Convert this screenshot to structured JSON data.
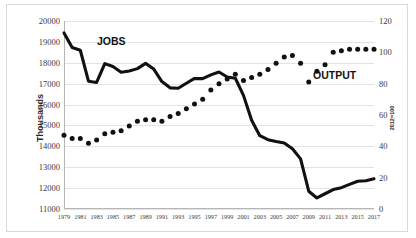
{
  "chart_data": {
    "type": "line",
    "title": "",
    "xlabel": "",
    "ylabel": "Thousands",
    "y2label": "2012=100",
    "grid": true,
    "legend_position": "inline-annotation",
    "x": [
      1979,
      1980,
      1981,
      1982,
      1983,
      1984,
      1985,
      1986,
      1987,
      1988,
      1989,
      1990,
      1991,
      1992,
      1993,
      1994,
      1995,
      1996,
      1997,
      1998,
      1999,
      2000,
      2001,
      2002,
      2003,
      2004,
      2005,
      2006,
      2007,
      2008,
      2009,
      2010,
      2011,
      2012,
      2013,
      2014,
      2015,
      2016,
      2017
    ],
    "xtick_labels": [
      "1979",
      "1981",
      "1983",
      "1985",
      "1987",
      "1989",
      "1991",
      "1993",
      "1995",
      "1997",
      "1999",
      "2001",
      "2003",
      "2005",
      "2007",
      "2009",
      "2011",
      "2013",
      "2015",
      "2017"
    ],
    "ylim": [
      11000,
      20000
    ],
    "ytick_labels": [
      "11000",
      "12000",
      "13000",
      "14000",
      "15000",
      "16000",
      "17000",
      "18000",
      "19000",
      "20000"
    ],
    "y2lim": [
      0,
      120
    ],
    "y2tick_labels": [
      "0",
      "20",
      "40",
      "60",
      "80",
      "100",
      "120"
    ],
    "series": [
      {
        "name": "JOBS",
        "axis": "left",
        "style": "solid-line",
        "unit": "thousands of jobs",
        "values": [
          19430,
          18730,
          18600,
          17120,
          17060,
          17960,
          17820,
          17550,
          17610,
          17720,
          17970,
          17700,
          17100,
          16800,
          16780,
          17020,
          17250,
          17240,
          17420,
          17560,
          17320,
          17260,
          16440,
          15250,
          14510,
          14320,
          14230,
          14160,
          13880,
          13400,
          11850,
          11530,
          11730,
          11930,
          12020,
          12180,
          12330,
          12350,
          12450
        ]
      },
      {
        "name": "OUTPUT",
        "axis": "right",
        "style": "dotted",
        "unit": "index, 2012=100",
        "values": [
          47,
          45,
          45,
          42,
          44,
          48,
          49,
          50,
          53,
          56,
          57,
          57,
          56,
          59,
          61,
          64,
          67,
          70,
          76,
          80,
          83,
          86,
          82,
          84,
          86,
          89,
          93,
          97,
          98,
          93,
          81,
          88,
          92,
          100,
          101,
          102,
          102,
          102,
          102
        ]
      }
    ],
    "annotations": [
      {
        "text": "JOBS",
        "series": "JOBS"
      },
      {
        "text": "OUTPUT",
        "series": "OUTPUT"
      }
    ]
  },
  "axes": {
    "left_title": "Thousands",
    "right_title": "2012=100"
  }
}
